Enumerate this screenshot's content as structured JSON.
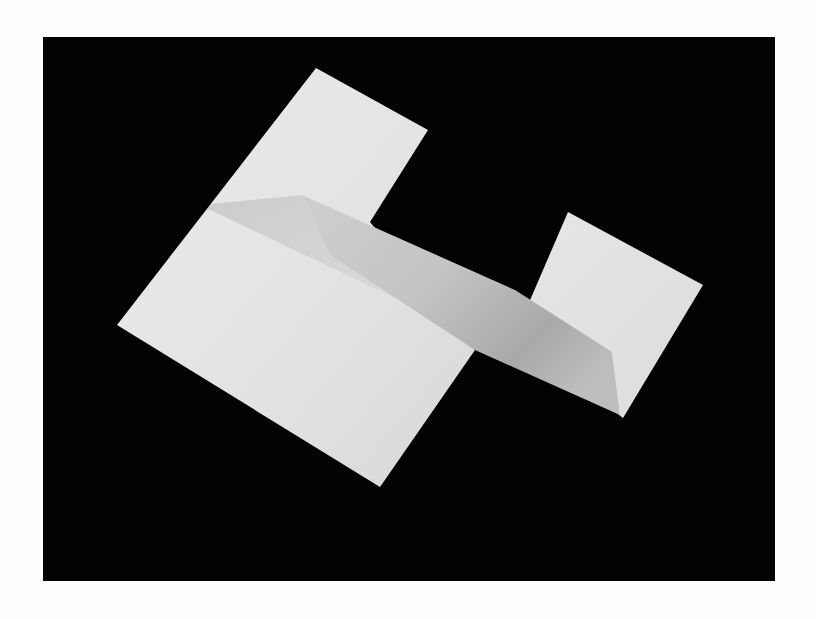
{
  "image": {
    "subject": "folded-white-paper-on-black-background",
    "colors": {
      "page_background": "#fdfdfd",
      "backdrop": "#020202",
      "paper_light": "#e9e9e9",
      "paper_mid": "#d4d4d4",
      "paper_shadow": "#b2b2b2",
      "paper_dark": "#9e9e9e"
    }
  }
}
